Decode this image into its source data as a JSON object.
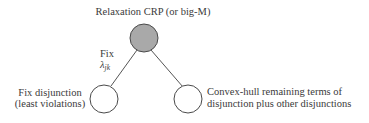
{
  "diagram": {
    "root": {
      "label": "Relaxation CRP (or big-M)",
      "fill": "#a9a9a9"
    },
    "edge_label": {
      "line1": "Fix",
      "symbol": "λ",
      "subscript": "jk"
    },
    "left_child": {
      "line1": "Fix disjunction",
      "line2": "(least violations)",
      "fill": "#ffffff"
    },
    "right_child": {
      "line1": "Convex-hull remaining terms of",
      "line2": "disjunction plus other disjunctions",
      "fill": "#ffffff"
    }
  }
}
